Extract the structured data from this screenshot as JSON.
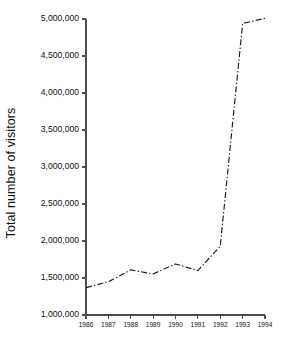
{
  "chart_data": {
    "type": "line",
    "title": "",
    "subtitle": "",
    "xlabel": "",
    "ylabel": "Total number of visitors",
    "x": [
      1986,
      1987,
      1988,
      1989,
      1990,
      1991,
      1992,
      1993,
      1994
    ],
    "categories": [
      "1986",
      "1987",
      "1988",
      "1989",
      "1990",
      "1991",
      "1992",
      "1993",
      "1994"
    ],
    "values": [
      1370000,
      1450000,
      1610000,
      1555000,
      1690000,
      1600000,
      1930000,
      4940000,
      5010000
    ],
    "series": [
      {
        "name": "Total number of visitors",
        "values": [
          1370000,
          1450000,
          1610000,
          1555000,
          1690000,
          1600000,
          1930000,
          4940000,
          5010000
        ],
        "line_style": "dash-dot",
        "color": "#1b1b1b",
        "markers": "none"
      }
    ],
    "xlim": [
      1986,
      1994
    ],
    "ylim": [
      1000000,
      5000000
    ],
    "ytick_values": [
      1000000,
      1500000,
      2000000,
      2500000,
      3000000,
      3500000,
      4000000,
      4500000,
      5000000
    ],
    "ytick_labels": [
      "1,000,000",
      "1,500,000",
      "2,000,000",
      "2,500,000",
      "3,000,000",
      "3,500,000",
      "4,000,000",
      "4,500,000",
      "5,000,000"
    ],
    "xtick_values": [
      1986,
      1987,
      1988,
      1989,
      1990,
      1991,
      1992,
      1993,
      1994
    ],
    "xtick_labels": [
      "1986",
      "1987",
      "1988",
      "1989",
      "1990",
      "1991",
      "1992",
      "1993",
      "1994"
    ],
    "grid": false,
    "legend": false,
    "legend_position": "none",
    "spines": [
      "left",
      "bottom"
    ],
    "tick_direction": "out",
    "background_color": "#ffffff",
    "axis_color": "#4d4d4d",
    "text_color": "#111111"
  },
  "layout": {
    "plot_left": 86,
    "plot_right": 265,
    "plot_top": 19,
    "plot_bottom": 315
  }
}
